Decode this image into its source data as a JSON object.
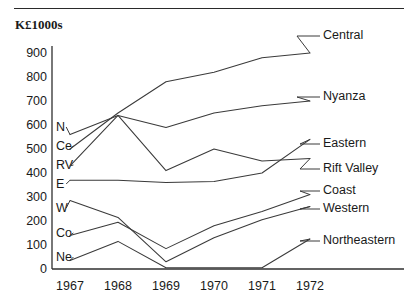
{
  "figure": {
    "unit_title": "K£1000s",
    "top_rule": true
  },
  "chart_data": {
    "type": "line",
    "title": "K£1000s",
    "xlabel": "",
    "ylabel": "K£1000s",
    "x": [
      1967,
      1968,
      1969,
      1970,
      1971,
      1972
    ],
    "categories": [
      "1967",
      "1968",
      "1969",
      "1970",
      "1971",
      "1972"
    ],
    "xtick_labels": [
      "1967",
      "1968",
      "1969",
      "1970",
      "1971",
      "1972"
    ],
    "ytick_labels": [
      "900",
      "800",
      "700",
      "600",
      "500",
      "400",
      "300",
      "200",
      "100",
      "0"
    ],
    "ytick_values": [
      900,
      800,
      700,
      600,
      500,
      400,
      300,
      200,
      100,
      0
    ],
    "ylim": [
      0,
      900
    ],
    "xlim": [
      1967,
      1972
    ],
    "grid": false,
    "legend_position": "right-inline-labels",
    "series": [
      {
        "name": "Central",
        "short": "Ce",
        "values": [
          500,
          650,
          780,
          820,
          880,
          900
        ],
        "label_right": "Central",
        "label_left": "Ce"
      },
      {
        "name": "Nyanza",
        "short": "N",
        "values": [
          560,
          640,
          590,
          650,
          680,
          700
        ],
        "label_right": "Nyanza",
        "label_left": "N"
      },
      {
        "name": "Eastern",
        "short": "E",
        "values": [
          370,
          370,
          360,
          365,
          400,
          540
        ],
        "label_right": "Eastern",
        "label_left": "E"
      },
      {
        "name": "Rift Valley",
        "short": "RV",
        "values": [
          430,
          640,
          410,
          500,
          450,
          460
        ],
        "label_right": "Rift Valley",
        "label_left": "RV"
      },
      {
        "name": "Coast",
        "short": "Co",
        "values": [
          140,
          195,
          85,
          180,
          240,
          310
        ],
        "label_right": "Coast",
        "label_left": "Co"
      },
      {
        "name": "Western",
        "short": "W",
        "values": [
          285,
          215,
          30,
          130,
          205,
          260
        ],
        "label_right": "Western",
        "label_left": "W"
      },
      {
        "name": "Northeastern",
        "short": "Ne",
        "values": [
          35,
          115,
          5,
          5,
          5,
          125
        ],
        "label_right": "Northeastern",
        "label_left": "Ne"
      }
    ]
  }
}
